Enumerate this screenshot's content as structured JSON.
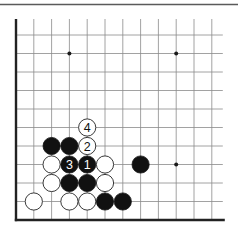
{
  "diagram": {
    "type": "go-board-fragment",
    "corner": "lower-left",
    "columns_visible": 12,
    "rows_visible": 11,
    "colors": {
      "black_stone": "#111111",
      "white_stone": "#ffffff",
      "grid": "#8a8a8a",
      "edge": "#222222",
      "top_rule": "#5a5a5a"
    },
    "star_points": [
      {
        "col": 3,
        "row": 1
      },
      {
        "col": 9,
        "row": 1
      },
      {
        "col": 9,
        "row": 7
      }
    ],
    "stones": [
      {
        "color": "white",
        "col": 4,
        "row": 5,
        "label": "4"
      },
      {
        "color": "white",
        "col": 4,
        "row": 6,
        "label": "2"
      },
      {
        "color": "black",
        "col": 2,
        "row": 6,
        "label": ""
      },
      {
        "color": "black",
        "col": 3,
        "row": 6,
        "label": ""
      },
      {
        "color": "white",
        "col": 2,
        "row": 7,
        "label": ""
      },
      {
        "color": "black",
        "col": 3,
        "row": 7,
        "label": "3"
      },
      {
        "color": "black",
        "col": 4,
        "row": 7,
        "label": "1"
      },
      {
        "color": "white",
        "col": 5,
        "row": 7,
        "label": ""
      },
      {
        "color": "black",
        "col": 7,
        "row": 7,
        "label": ""
      },
      {
        "color": "white",
        "col": 2,
        "row": 8,
        "label": ""
      },
      {
        "color": "black",
        "col": 3,
        "row": 8,
        "label": ""
      },
      {
        "color": "black",
        "col": 4,
        "row": 8,
        "label": ""
      },
      {
        "color": "white",
        "col": 5,
        "row": 8,
        "label": ""
      },
      {
        "color": "white",
        "col": 1,
        "row": 9,
        "label": ""
      },
      {
        "color": "white",
        "col": 3,
        "row": 9,
        "label": ""
      },
      {
        "color": "white",
        "col": 4,
        "row": 9,
        "label": ""
      },
      {
        "color": "black",
        "col": 5,
        "row": 9,
        "label": ""
      },
      {
        "color": "black",
        "col": 6,
        "row": 9,
        "label": ""
      }
    ],
    "move_sequence": [
      {
        "move": "1",
        "color": "black"
      },
      {
        "move": "2",
        "color": "white"
      },
      {
        "move": "3",
        "color": "black"
      },
      {
        "move": "4",
        "color": "white"
      }
    ]
  }
}
